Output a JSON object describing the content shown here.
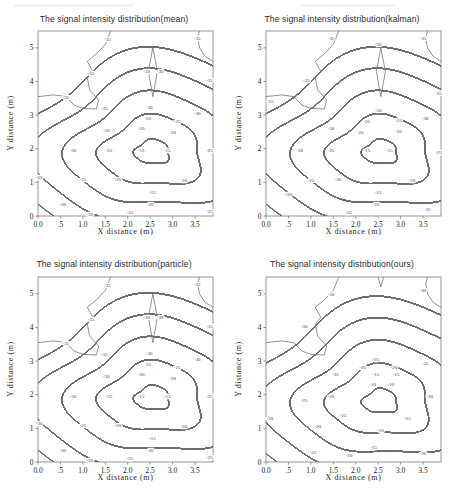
{
  "figure": {
    "panel_count": 4,
    "axis": {
      "x_label": "X distance (m)",
      "y_label": "Y distance (m)",
      "x_ticks": [
        "0.0",
        ".5",
        "1.0",
        "1.5",
        "2.0",
        "2.5",
        "3.0",
        "3.5"
      ],
      "x_tick_values": [
        0.0,
        0.5,
        1.0,
        1.5,
        2.0,
        2.5,
        3.0,
        3.5
      ],
      "y_ticks": [
        "0",
        "1",
        "2",
        "3",
        "4",
        "5"
      ],
      "y_tick_values": [
        0,
        1,
        2,
        3,
        4,
        5
      ],
      "xlim": [
        0.0,
        3.9
      ],
      "ylim": [
        0.0,
        5.5
      ],
      "grid": false,
      "line_color": "#6e6e72",
      "frame_color": "#8a8a8e"
    },
    "panels": [
      {
        "id": "mean",
        "title": "The signal intensity distribution(mean)",
        "levels": [
          -35,
          -30,
          -25,
          -20,
          -15
        ],
        "labels": [
          "-35",
          "-30",
          "-25",
          "-20",
          "-15"
        ]
      },
      {
        "id": "kalman",
        "title": "The signal intensity distribution(kalman)",
        "levels": [
          -35,
          -30,
          -25,
          -20,
          -15
        ],
        "labels": [
          "-35",
          "-30",
          "-25",
          "-20",
          "-15"
        ]
      },
      {
        "id": "particle",
        "title": "The signal intensity distribution(particle)",
        "levels": [
          -35,
          -30,
          -25,
          -20,
          -15
        ],
        "labels": [
          "-35",
          "-30",
          "-25",
          "-20",
          "-15"
        ]
      },
      {
        "id": "ours",
        "title": "The signal intensity distribution(ours)",
        "levels": [
          -30,
          -25,
          -20,
          -15,
          -10
        ],
        "labels": [
          "-30",
          "-25",
          "-20",
          "-15",
          "-10"
        ]
      }
    ]
  },
  "chart_data": {
    "type": "line",
    "chart_kind": "contour",
    "xlabel": "X distance (m)",
    "ylabel": "Y distance (m)",
    "xlim": [
      0.0,
      3.9
    ],
    "ylim": [
      0.0,
      5.5
    ],
    "units": "dBm",
    "grid": false,
    "legend": "none",
    "subplots": [
      {
        "name": "mean",
        "title": "The signal intensity distribution(mean)",
        "contour_levels": [
          -35,
          -30,
          -25,
          -20,
          -15
        ],
        "peak_center": [
          2.55,
          1.9
        ],
        "peak_level": -15,
        "inline_labels": [
          {
            "text": "-35",
            "x": 1.55,
            "y": 5.25
          },
          {
            "text": "-35",
            "x": 3.55,
            "y": 5.3
          },
          {
            "text": "-35",
            "x": 1.18,
            "y": 4.25
          },
          {
            "text": "-35",
            "x": 0.62,
            "y": 3.52
          },
          {
            "text": "-35",
            "x": 1.48,
            "y": 3.2
          },
          {
            "text": "-35",
            "x": 3.82,
            "y": 4.05
          },
          {
            "text": "-30",
            "x": 2.42,
            "y": 4.3
          },
          {
            "text": "-30",
            "x": 2.72,
            "y": 4.3
          },
          {
            "text": "-30",
            "x": 2.48,
            "y": 3.22
          },
          {
            "text": "-30",
            "x": 3.55,
            "y": 3.05
          },
          {
            "text": "-30",
            "x": 1.52,
            "y": 2.55
          },
          {
            "text": "-30",
            "x": 0.78,
            "y": 1.95
          },
          {
            "text": "-30",
            "x": 0.02,
            "y": 1.15
          },
          {
            "text": "-30",
            "x": 0.55,
            "y": 0.35
          },
          {
            "text": "-30",
            "x": 1.15,
            "y": 0.05
          },
          {
            "text": "-25",
            "x": 2.45,
            "y": 2.9
          },
          {
            "text": "-25",
            "x": 3.1,
            "y": 2.82
          },
          {
            "text": "-25",
            "x": 3.82,
            "y": 1.95
          },
          {
            "text": "-25",
            "x": 1.58,
            "y": 1.95
          },
          {
            "text": "-25",
            "x": 1.0,
            "y": 1.1
          },
          {
            "text": "-25",
            "x": 2.05,
            "y": 0.1
          },
          {
            "text": "-25",
            "x": 3.82,
            "y": 0.15
          },
          {
            "text": "-20",
            "x": 2.3,
            "y": 2.6
          },
          {
            "text": "-20",
            "x": 3.0,
            "y": 2.5
          },
          {
            "text": "-20",
            "x": 1.78,
            "y": 1.1
          },
          {
            "text": "-20",
            "x": 3.25,
            "y": 1.05
          },
          {
            "text": "-20",
            "x": 2.5,
            "y": 0.35
          },
          {
            "text": "-15",
            "x": 2.3,
            "y": 1.95
          },
          {
            "text": "-15",
            "x": 2.88,
            "y": 1.95
          },
          {
            "text": "-15",
            "x": 2.55,
            "y": 0.72
          }
        ]
      },
      {
        "name": "kalman",
        "title": "The signal intensity distribution(kalman)",
        "contour_levels": [
          -35,
          -30,
          -25,
          -20,
          -15
        ],
        "peak_center": [
          2.55,
          1.9
        ],
        "peak_level": -15,
        "inline_labels": [
          {
            "text": "-35",
            "x": 1.45,
            "y": 5.3
          },
          {
            "text": "-35",
            "x": 3.5,
            "y": 5.3
          },
          {
            "text": "-35",
            "x": 0.9,
            "y": 4.05
          },
          {
            "text": "-35",
            "x": 0.1,
            "y": 3.4
          },
          {
            "text": "-35",
            "x": 3.85,
            "y": 3.65
          },
          {
            "text": "-30",
            "x": 2.5,
            "y": 5.1
          },
          {
            "text": "-30",
            "x": 2.5,
            "y": 3.15
          },
          {
            "text": "-30",
            "x": 3.55,
            "y": 2.9
          },
          {
            "text": "-30",
            "x": 1.45,
            "y": 2.6
          },
          {
            "text": "-30",
            "x": 0.75,
            "y": 1.95
          },
          {
            "text": "-30",
            "x": 0.5,
            "y": 0.65
          },
          {
            "text": "-25",
            "x": 2.25,
            "y": 2.82
          },
          {
            "text": "-25",
            "x": 2.95,
            "y": 2.85
          },
          {
            "text": "-25",
            "x": 1.45,
            "y": 1.95
          },
          {
            "text": "-25",
            "x": 3.85,
            "y": 1.9
          },
          {
            "text": "-25",
            "x": 1.0,
            "y": 1.05
          },
          {
            "text": "-25",
            "x": 1.85,
            "y": 0.12
          },
          {
            "text": "-25",
            "x": 3.6,
            "y": 0.2
          },
          {
            "text": "-20",
            "x": 2.1,
            "y": 2.5
          },
          {
            "text": "-20",
            "x": 2.95,
            "y": 2.52
          },
          {
            "text": "-20",
            "x": 1.6,
            "y": 1.1
          },
          {
            "text": "-20",
            "x": 3.25,
            "y": 1.05
          },
          {
            "text": "-20",
            "x": 2.45,
            "y": 0.35
          },
          {
            "text": "-15",
            "x": 2.25,
            "y": 1.95
          },
          {
            "text": "-15",
            "x": 2.75,
            "y": 1.95
          },
          {
            "text": "-15",
            "x": 2.5,
            "y": 0.7
          }
        ]
      },
      {
        "name": "particle",
        "title": "The signal intensity distribution(particle)",
        "contour_levels": [
          -35,
          -30,
          -25,
          -20,
          -15
        ],
        "peak_center": [
          2.55,
          1.9
        ],
        "peak_level": -15,
        "inline_labels": [
          {
            "text": "-35",
            "x": 1.55,
            "y": 5.25
          },
          {
            "text": "-35",
            "x": 3.55,
            "y": 5.3
          },
          {
            "text": "-35",
            "x": 1.18,
            "y": 4.25
          },
          {
            "text": "-35",
            "x": 0.62,
            "y": 3.52
          },
          {
            "text": "-35",
            "x": 1.48,
            "y": 3.2
          },
          {
            "text": "-35",
            "x": 3.82,
            "y": 4.05
          },
          {
            "text": "-30",
            "x": 2.42,
            "y": 4.3
          },
          {
            "text": "-30",
            "x": 2.72,
            "y": 4.3
          },
          {
            "text": "-30",
            "x": 2.48,
            "y": 3.22
          },
          {
            "text": "-30",
            "x": 3.55,
            "y": 3.05
          },
          {
            "text": "-30",
            "x": 1.52,
            "y": 2.55
          },
          {
            "text": "-30",
            "x": 0.78,
            "y": 1.95
          },
          {
            "text": "-30",
            "x": 0.02,
            "y": 1.15
          },
          {
            "text": "-30",
            "x": 0.55,
            "y": 0.35
          },
          {
            "text": "-30",
            "x": 1.15,
            "y": 0.05
          },
          {
            "text": "-25",
            "x": 2.45,
            "y": 2.9
          },
          {
            "text": "-25",
            "x": 3.1,
            "y": 2.82
          },
          {
            "text": "-25",
            "x": 3.82,
            "y": 1.95
          },
          {
            "text": "-25",
            "x": 1.58,
            "y": 1.95
          },
          {
            "text": "-25",
            "x": 1.0,
            "y": 1.1
          },
          {
            "text": "-25",
            "x": 2.05,
            "y": 0.1
          },
          {
            "text": "-25",
            "x": 3.82,
            "y": 0.15
          },
          {
            "text": "-20",
            "x": 2.3,
            "y": 2.6
          },
          {
            "text": "-20",
            "x": 3.0,
            "y": 2.5
          },
          {
            "text": "-20",
            "x": 1.78,
            "y": 1.1
          },
          {
            "text": "-20",
            "x": 3.25,
            "y": 1.05
          },
          {
            "text": "-20",
            "x": 2.5,
            "y": 0.35
          },
          {
            "text": "-15",
            "x": 2.3,
            "y": 1.95
          },
          {
            "text": "-15",
            "x": 2.88,
            "y": 1.95
          },
          {
            "text": "-15",
            "x": 2.55,
            "y": 0.72
          }
        ]
      },
      {
        "name": "ours",
        "title": "The signal intensity distribution(ours)",
        "contour_levels": [
          -30,
          -25,
          -20,
          -15,
          -10
        ],
        "peak_center": [
          2.55,
          1.8
        ],
        "peak_level": -10,
        "inline_labels": [
          {
            "text": "-30",
            "x": 1.45,
            "y": 5.0
          },
          {
            "text": "-30",
            "x": 3.5,
            "y": 5.1
          },
          {
            "text": "-30",
            "x": 0.85,
            "y": 4.05
          },
          {
            "text": "-30",
            "x": 0.08,
            "y": 1.3
          },
          {
            "text": "-25",
            "x": 2.45,
            "y": 3.05
          },
          {
            "text": "-25",
            "x": 3.55,
            "y": 2.95
          },
          {
            "text": "-25",
            "x": 1.55,
            "y": 2.6
          },
          {
            "text": "-25",
            "x": 0.85,
            "y": 1.85
          },
          {
            "text": "-25",
            "x": 1.05,
            "y": 0.3
          },
          {
            "text": "-20",
            "x": 2.15,
            "y": 2.82
          },
          {
            "text": "-20",
            "x": 2.85,
            "y": 2.82
          },
          {
            "text": "-20",
            "x": 1.45,
            "y": 1.95
          },
          {
            "text": "-20",
            "x": 3.65,
            "y": 1.95
          },
          {
            "text": "-20",
            "x": 1.15,
            "y": 1.05
          },
          {
            "text": "-20",
            "x": 1.85,
            "y": 0.2
          },
          {
            "text": "-20",
            "x": 3.5,
            "y": 0.25
          },
          {
            "text": "-15",
            "x": 2.45,
            "y": 2.62
          },
          {
            "text": "-15",
            "x": 2.9,
            "y": 2.6
          },
          {
            "text": "-15",
            "x": 1.72,
            "y": 1.4
          },
          {
            "text": "-15",
            "x": 3.15,
            "y": 1.3
          },
          {
            "text": "-15",
            "x": 2.4,
            "y": 0.45
          },
          {
            "text": "-10",
            "x": 2.38,
            "y": 2.3
          },
          {
            "text": "-10",
            "x": 2.78,
            "y": 2.3
          },
          {
            "text": "-10",
            "x": 2.55,
            "y": 0.95
          }
        ]
      }
    ]
  }
}
